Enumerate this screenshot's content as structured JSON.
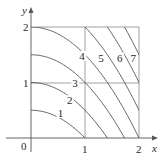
{
  "figure": {
    "type": "contour_plot",
    "axes": {
      "x_label": "x",
      "y_label": "y",
      "origin_label": "0",
      "x_ticks": [
        "1",
        "2"
      ],
      "y_ticks": [
        "1",
        "2"
      ],
      "x_range": [
        0,
        2
      ],
      "y_range": [
        0,
        2
      ]
    },
    "grid_lines": {
      "x": [
        1,
        2
      ],
      "y": [
        1,
        2
      ]
    },
    "level_curves": [
      {
        "label": "1",
        "k": 1
      },
      {
        "label": "2",
        "k": 2
      },
      {
        "label": "3",
        "k": 3
      },
      {
        "label": "4",
        "k": 4
      },
      {
        "label": "5",
        "k": 5
      },
      {
        "label": "6",
        "k": 6
      },
      {
        "label": "7",
        "k": 7
      }
    ],
    "colors": {
      "curves": "#555555",
      "axes": "#555555",
      "grid": "#888888"
    }
  }
}
